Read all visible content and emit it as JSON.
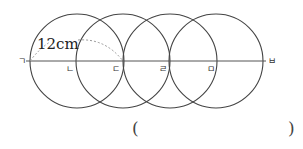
{
  "diagram": {
    "measure_label": "12cm",
    "points": [
      {
        "label": "ㄱ",
        "x": 30
      },
      {
        "label": "ㄴ",
        "x": 78
      },
      {
        "label": "ㄷ",
        "x": 123
      },
      {
        "label": "ㄹ",
        "x": 170
      },
      {
        "label": "ㅁ",
        "x": 216
      },
      {
        "label": "ㅂ",
        "x": 264
      }
    ],
    "circle_count": 4,
    "radius_px": 47,
    "line_color": "#444444",
    "dash_color": "#999999"
  },
  "answer": {
    "open_paren": "(",
    "close_paren": ")",
    "value": ""
  }
}
